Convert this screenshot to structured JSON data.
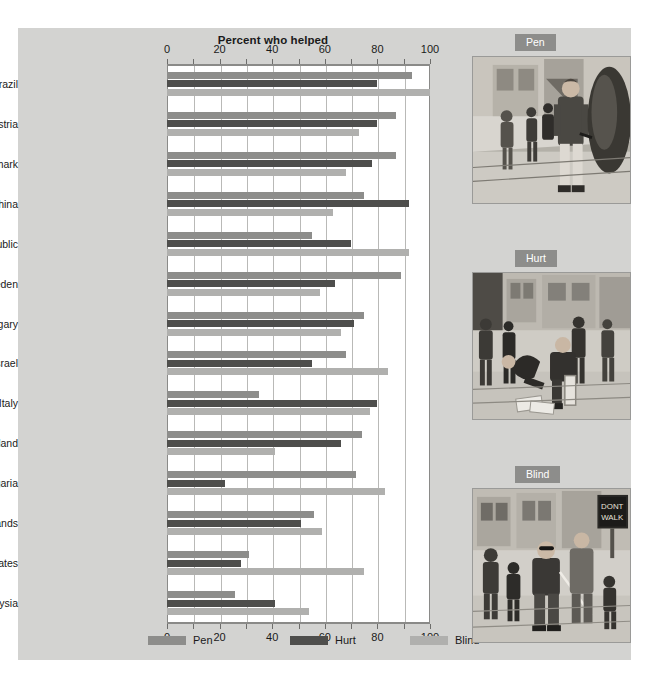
{
  "chart_data": {
    "type": "bar",
    "orientation": "horizontal-grouped",
    "title": "Percent who helped",
    "xlabel": "Percent who helped",
    "ylabel": "",
    "xlim": [
      0,
      100
    ],
    "xticks": [
      0,
      20,
      40,
      60,
      80,
      100
    ],
    "xtick_labels": [
      "0",
      "20",
      "40",
      "60",
      "80",
      "100"
    ],
    "minor_tick_step": 10,
    "grid": true,
    "legend_position": "bottom",
    "categories": [
      "Rio de Janeiro, Brazil",
      "Vienna, Austria",
      "Copenhagen, Denmark",
      "Shanghai, China",
      "Prague, Czech Republic",
      "Stockholm, Sweden",
      "Budapest, Hungary",
      "Tel Aviv, Israel",
      "Rome, Italy",
      "Bangkok, Thailand",
      "Sofia, Bulgaria",
      "Amsterdam, Netherlands",
      "New York, United States",
      "Kuala Lumpur, Malaysia"
    ],
    "series": [
      {
        "name": "Pen",
        "color": "#8d8d8b",
        "values": [
          93,
          87,
          87,
          75,
          55,
          89,
          75,
          68,
          35,
          74,
          72,
          56,
          31,
          26
        ]
      },
      {
        "name": "Hurt",
        "color": "#4e4e4c",
        "values": [
          80,
          80,
          78,
          92,
          70,
          64,
          71,
          55,
          80,
          66,
          22,
          51,
          28,
          41
        ]
      },
      {
        "name": "Blind",
        "color": "#b0b0ae",
        "values": [
          100,
          73,
          68,
          63,
          92,
          58,
          66,
          84,
          77,
          41,
          83,
          59,
          75,
          54
        ]
      }
    ]
  },
  "legend": {
    "items": [
      {
        "label": "Pen",
        "color": "#8d8d8b"
      },
      {
        "label": "Hurt",
        "color": "#4e4e4c"
      },
      {
        "label": "Blind",
        "color": "#b0b0ae"
      }
    ]
  },
  "illustrations": [
    {
      "badge": "Pen",
      "alt": "pedestrian dropping a pen on a city sidewalk"
    },
    {
      "badge": "Hurt",
      "alt": "person with an injured leg dropping magazines on a street"
    },
    {
      "badge": "Blind",
      "alt": "blind person with cane at a crosswalk with DONT WALK sign"
    }
  ]
}
